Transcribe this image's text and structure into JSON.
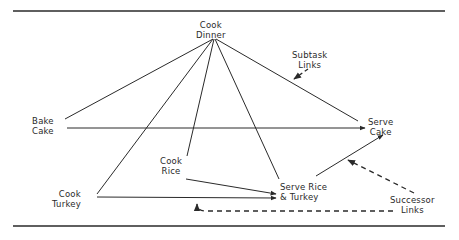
{
  "diagram": {
    "nodes": {
      "cook_dinner": {
        "line1": "Cook",
        "line2": "Dinner"
      },
      "bake_cake": {
        "line1": "Bake",
        "line2": "Cake"
      },
      "serve_cake": {
        "line1": "Serve",
        "line2": "Cake"
      },
      "cook_rice": {
        "line1": "Cook",
        "line2": "Rice"
      },
      "cook_turkey": {
        "line1": "Cook",
        "line2": "Turkey"
      },
      "serve_rice_turkey": {
        "line1": "Serve Rice",
        "line2": "& Turkey"
      }
    },
    "annotations": {
      "subtask_links": {
        "line1": "Subtask",
        "line2": "Links"
      },
      "successor_links": {
        "line1": "Successor",
        "line2": "Links"
      }
    },
    "edges": {
      "subtask": [
        {
          "from": "Cook Dinner",
          "to": "Bake Cake"
        },
        {
          "from": "Cook Dinner",
          "to": "Cook Turkey"
        },
        {
          "from": "Cook Dinner",
          "to": "Cook Rice"
        },
        {
          "from": "Cook Dinner",
          "to": "Serve Rice & Turkey"
        },
        {
          "from": "Cook Dinner",
          "to": "Serve Cake"
        }
      ],
      "successor": [
        {
          "from": "Bake Cake",
          "to": "Serve Cake"
        },
        {
          "from": "Cook Rice",
          "to": "Serve Rice & Turkey"
        },
        {
          "from": "Cook Turkey",
          "to": "Serve Rice & Turkey"
        },
        {
          "from": "Serve Rice & Turkey",
          "to": "Serve Cake"
        }
      ]
    },
    "colors": {
      "ink": "#2a2a2a",
      "background": "#ffffff"
    }
  }
}
